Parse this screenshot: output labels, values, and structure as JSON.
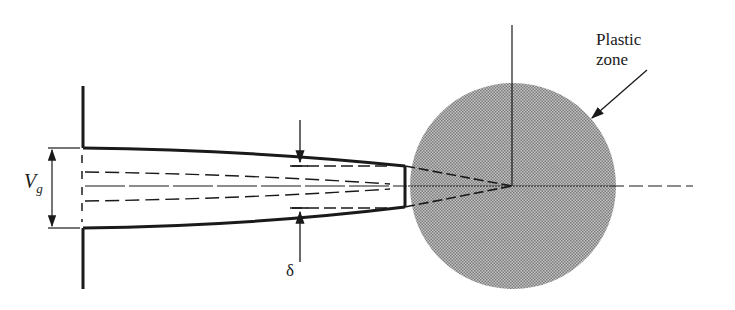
{
  "figure": {
    "labels": {
      "plastic_zone_line1": "Plastic",
      "plastic_zone_line2": "zone",
      "crack_opening_symbol": "V",
      "crack_opening_subscript": "g",
      "displacement_symbol": "δ"
    },
    "colors": {
      "ink": "#1a1a1a",
      "plastic_zone_fill": "#a8a8a8"
    }
  }
}
